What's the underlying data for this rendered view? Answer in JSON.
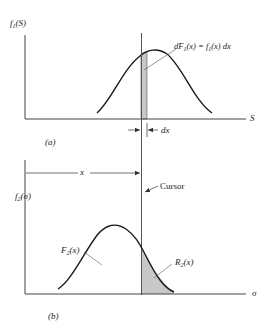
{
  "figure": {
    "panel_a": {
      "caption": "(a)",
      "y_axis_label": {
        "base": "f",
        "sub": "1",
        "arg": "(S)"
      },
      "x_axis_label": "S",
      "strip_annotation": {
        "lhs": "dF",
        "lhs_sub": "1",
        "lhs_arg": "(x) = ",
        "rhs": "f",
        "rhs_sub": "1",
        "rhs_arg": "(x) dx"
      },
      "width_label": "dx",
      "curve": "normal-pdf",
      "shaded_region": "strip of width dx at x"
    },
    "panel_b": {
      "caption": "(b)",
      "y_axis_label": {
        "base": "f",
        "sub": "2",
        "arg": "(σ)"
      },
      "x_axis_label": "σ",
      "distance_label": "x",
      "cursor_label": "Cursor",
      "left_area_label": {
        "base": "F",
        "sub": "2",
        "arg": "(x)"
      },
      "right_area_label": {
        "base": "R",
        "sub": "2",
        "arg": "(x)"
      },
      "curve": "normal-pdf",
      "shaded_region": "right tail beyond cursor"
    },
    "colors": {
      "ink": "#1a1a1a",
      "axis": "#444444",
      "shade": "#c8c8c8"
    }
  }
}
